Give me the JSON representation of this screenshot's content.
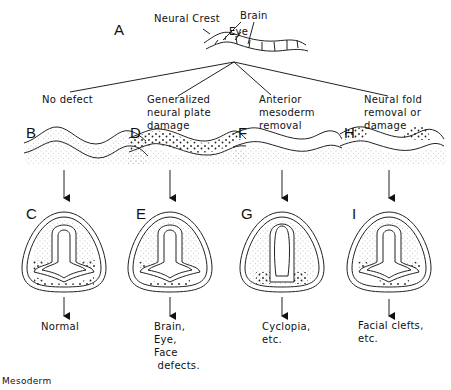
{
  "figure": {
    "top": {
      "letter": "A",
      "labels": {
        "neural_crest": "Neural Crest",
        "brain": "Brain",
        "eye": "Eye"
      }
    },
    "columns": [
      {
        "id": "B",
        "condition": "No defect",
        "section_letter": "C",
        "outcome": "Normal"
      },
      {
        "id": "D",
        "condition": "Generalized\nneural plate\ndamage",
        "section_letter": "E",
        "outcome": "Brain,\nEye,\nFace\n defects."
      },
      {
        "id": "F",
        "condition": "Anterior\nmesoderm\nremoval",
        "section_letter": "G",
        "outcome": "Cyclopia,\netc."
      },
      {
        "id": "H",
        "condition": "Neural fold\nremoval or\ndamage",
        "section_letter": "I",
        "outcome": "Facial clefts,\netc."
      }
    ],
    "footer_label": "Mesoderm"
  }
}
